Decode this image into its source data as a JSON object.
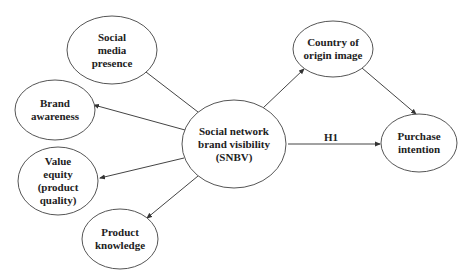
{
  "diagram": {
    "nodes": [
      {
        "id": "smp",
        "lines": [
          "Social",
          "media",
          "presence"
        ],
        "cx": 112,
        "cy": 50,
        "rx": 45,
        "ry": 34
      },
      {
        "id": "ba",
        "lines": [
          "Brand",
          "awareness"
        ],
        "cx": 55,
        "cy": 110,
        "rx": 40,
        "ry": 30
      },
      {
        "id": "ve",
        "lines": [
          "Value",
          "equity",
          "(product",
          "quality)"
        ],
        "cx": 58,
        "cy": 181,
        "rx": 40,
        "ry": 34
      },
      {
        "id": "pk",
        "lines": [
          "Product",
          "knowledge"
        ],
        "cx": 120,
        "cy": 239,
        "rx": 38,
        "ry": 30
      },
      {
        "id": "snbv",
        "lines": [
          "Social network",
          "brand visibility",
          "(SNBV)"
        ],
        "cx": 234,
        "cy": 144,
        "rx": 52,
        "ry": 44
      },
      {
        "id": "coo",
        "lines": [
          "Country of",
          "origin image"
        ],
        "cx": 333,
        "cy": 49,
        "rx": 40,
        "ry": 28
      },
      {
        "id": "pi",
        "lines": [
          "Purchase",
          "intention"
        ],
        "cx": 419,
        "cy": 143,
        "rx": 38,
        "ry": 29
      }
    ],
    "edges": [
      {
        "from": "snbv",
        "to": "smp",
        "x1": 198,
        "y1": 112,
        "x2": 133,
        "y2": 62,
        "label": ""
      },
      {
        "from": "snbv",
        "to": "ba",
        "x1": 185,
        "y1": 130,
        "x2": 94,
        "y2": 105,
        "label": ""
      },
      {
        "from": "snbv",
        "to": "ve",
        "x1": 184,
        "y1": 158,
        "x2": 100,
        "y2": 178,
        "label": ""
      },
      {
        "from": "snbv",
        "to": "pk",
        "x1": 198,
        "y1": 176,
        "x2": 147,
        "y2": 218,
        "label": ""
      },
      {
        "from": "snbv",
        "to": "coo",
        "x1": 263,
        "y1": 108,
        "x2": 304,
        "y2": 69,
        "label": ""
      },
      {
        "from": "coo",
        "to": "pi",
        "x1": 362,
        "y1": 68,
        "x2": 416,
        "y2": 114,
        "label": ""
      },
      {
        "from": "snbv",
        "to": "pi",
        "x1": 288,
        "y1": 144,
        "x2": 380,
        "y2": 144,
        "label": "H1"
      }
    ],
    "edge_labels": {
      "h1": "H1"
    }
  }
}
